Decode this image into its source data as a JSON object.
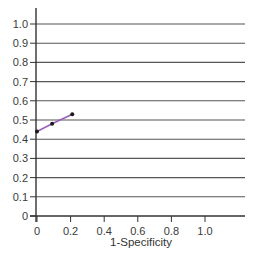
{
  "chart_data": {
    "type": "line",
    "title": "",
    "xlabel": "1-Specificity",
    "ylabel": "",
    "xlim": [
      0,
      1.0
    ],
    "ylim": [
      0,
      1.0
    ],
    "grid": "horizontal",
    "x_ticks": [
      "0",
      "0.2",
      "0.4",
      "0.6",
      "0.8",
      "1.0"
    ],
    "y_ticks": [
      "0",
      "0.1",
      "0.2",
      "0.3",
      "0.4",
      "0.5",
      "0.6",
      "0.7",
      "0.8",
      "0.9",
      "1.0"
    ],
    "series": [
      {
        "name": "ROC",
        "color": "#9b5fc0",
        "x": [
          0.0,
          0.09,
          0.21
        ],
        "y": [
          0.44,
          0.48,
          0.53
        ]
      }
    ]
  },
  "colors": {
    "line": "#9b5fc0",
    "marker": "#1a1a1a",
    "grid": "#555555",
    "axis": "#333333"
  }
}
